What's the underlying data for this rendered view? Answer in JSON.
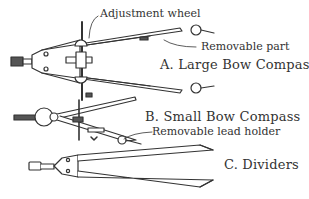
{
  "diagram": {
    "ink_color": "#333333",
    "background": "#ffffff",
    "instruments": [
      {
        "id": "A",
        "title": "A. Large Bow Compass",
        "callouts": [
          "Adjustment wheel",
          "Removable part"
        ]
      },
      {
        "id": "B",
        "title": "B. Small Bow Compass",
        "callouts": [
          "Removable lead holder"
        ]
      },
      {
        "id": "C",
        "title": "C. Dividers",
        "callouts": []
      }
    ]
  }
}
